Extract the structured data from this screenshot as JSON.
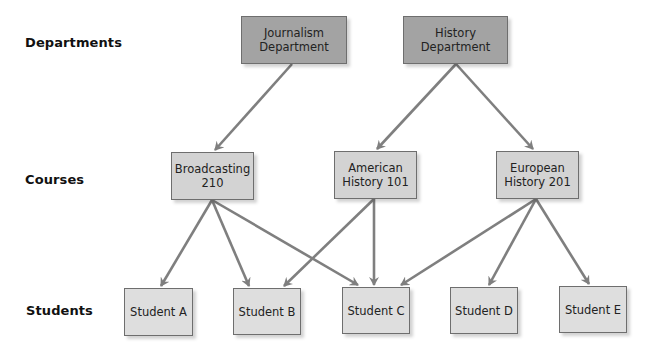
{
  "diagram": {
    "type": "hierarchy",
    "row_labels": {
      "departments": "Departments",
      "courses": "Courses",
      "students": "Students"
    },
    "colors": {
      "department_fill": "#a3a3a3",
      "course_fill": "#d3d3d3",
      "student_fill": "#dedede",
      "edge": "#7f7f7f"
    },
    "departments": [
      {
        "id": "journalism",
        "label": "Journalism\nDepartment"
      },
      {
        "id": "history",
        "label": "History\nDepartment"
      }
    ],
    "courses": [
      {
        "id": "broadcasting",
        "label": "Broadcasting\n210"
      },
      {
        "id": "american",
        "label": "American\nHistory 101"
      },
      {
        "id": "european",
        "label": "European\nHistory 201"
      }
    ],
    "students": [
      {
        "id": "a",
        "label": "Student A"
      },
      {
        "id": "b",
        "label": "Student B"
      },
      {
        "id": "c",
        "label": "Student C"
      },
      {
        "id": "d",
        "label": "Student D"
      },
      {
        "id": "e",
        "label": "Student E"
      }
    ],
    "edges": [
      {
        "from": "Journalism Department",
        "to": "Broadcasting 210"
      },
      {
        "from": "History Department",
        "to": "American History 101"
      },
      {
        "from": "History Department",
        "to": "European History 201"
      },
      {
        "from": "Broadcasting 210",
        "to": "Student A"
      },
      {
        "from": "Broadcasting 210",
        "to": "Student B"
      },
      {
        "from": "Broadcasting 210",
        "to": "Student C"
      },
      {
        "from": "American History 101",
        "to": "Student B"
      },
      {
        "from": "American History 101",
        "to": "Student C"
      },
      {
        "from": "European History 201",
        "to": "Student C"
      },
      {
        "from": "European History 201",
        "to": "Student D"
      },
      {
        "from": "European History 201",
        "to": "Student E"
      }
    ]
  }
}
